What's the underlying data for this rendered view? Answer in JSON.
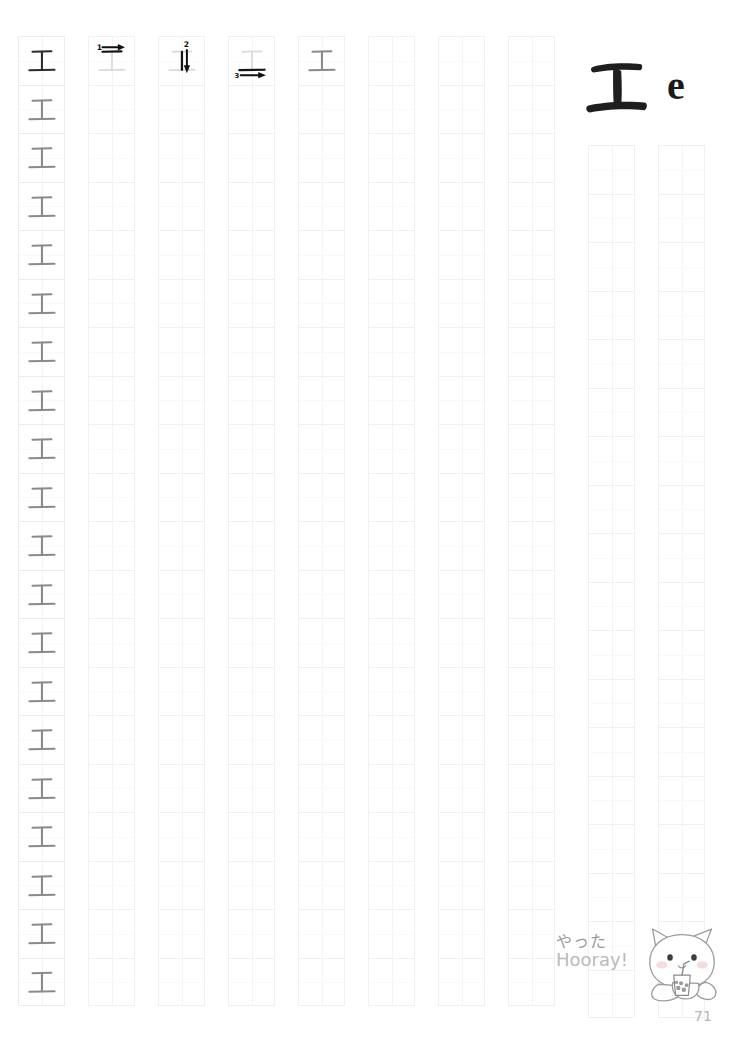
{
  "worksheet": {
    "character": "エ",
    "romaji": "e",
    "script": "katakana",
    "page_number": "71",
    "stroke_count": 3
  },
  "header": {
    "kana_display": "エ",
    "romaji_display": "e"
  },
  "stroke_order": {
    "steps": [
      {
        "number": "1",
        "name": "stroke-1-top-horizontal",
        "direction": "right"
      },
      {
        "number": "2",
        "name": "stroke-2-vertical",
        "direction": "down"
      },
      {
        "number": "3",
        "name": "stroke-3-bottom-horizontal",
        "direction": "right"
      }
    ]
  },
  "grid": {
    "rows": 20,
    "columns": 10,
    "column_roles": [
      "model-traced",
      "stroke-step-1",
      "stroke-step-2",
      "stroke-step-3",
      "complete-example",
      "practice",
      "practice",
      "practice",
      "practice-short",
      "practice-short"
    ]
  },
  "mascot": {
    "name": "cat-with-bubble-tea",
    "text_jp": "やった",
    "text_en": "Hooray!"
  },
  "colors": {
    "ink_dark": "#2b2b2b",
    "ink_gray": "#8a8a8e",
    "ink_light": "#d8d8dc",
    "grid_line": "#f0f0f2",
    "page_number": "#b5b5ba"
  },
  "footer": {
    "page_number": "71"
  }
}
